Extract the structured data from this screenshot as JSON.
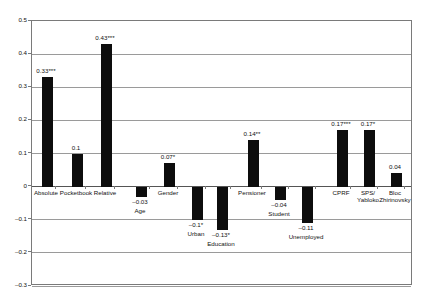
{
  "chart_data": {
    "type": "bar",
    "title": "",
    "subtitle": "",
    "xlabel": "",
    "ylabel": "",
    "ylim": [
      -0.3,
      0.5
    ],
    "ytick_labels": [
      "0.5",
      "0.4",
      "0.3",
      "0.2",
      "0.1",
      "0",
      "-0.1",
      "-0.2",
      "-0.3"
    ],
    "ytick_values": [
      0.5,
      0.4,
      0.3,
      0.2,
      0.1,
      0,
      -0.1,
      -0.2,
      -0.3
    ],
    "grid": true,
    "legend": "none",
    "bar_color": "#0d0d0d",
    "categories": [
      "Absolute",
      "Pocketbook",
      "Relative",
      "Age",
      "Gender",
      "Urban",
      "Education",
      "Pensioner",
      "Student",
      "Unemployed",
      "CPRF",
      "SPS/ Yabloko",
      "Bloc Zhirinovsky"
    ],
    "values": [
      0.33,
      0.1,
      0.43,
      -0.03,
      0.07,
      -0.1,
      -0.13,
      0.14,
      -0.04,
      -0.11,
      0.17,
      0.17,
      0.04
    ],
    "data_labels": [
      "0.33***",
      "0.1",
      "0.43***",
      "–0.03",
      "0.07*",
      "–0.1*",
      "–0.13*",
      "0.14**",
      "–0.04",
      "–0.11",
      "0.17***",
      "0.17*",
      "0.04"
    ],
    "significance": [
      "***",
      "",
      "***",
      "",
      "*",
      "*",
      "*",
      "**",
      "",
      "",
      "***",
      "*",
      ""
    ]
  }
}
